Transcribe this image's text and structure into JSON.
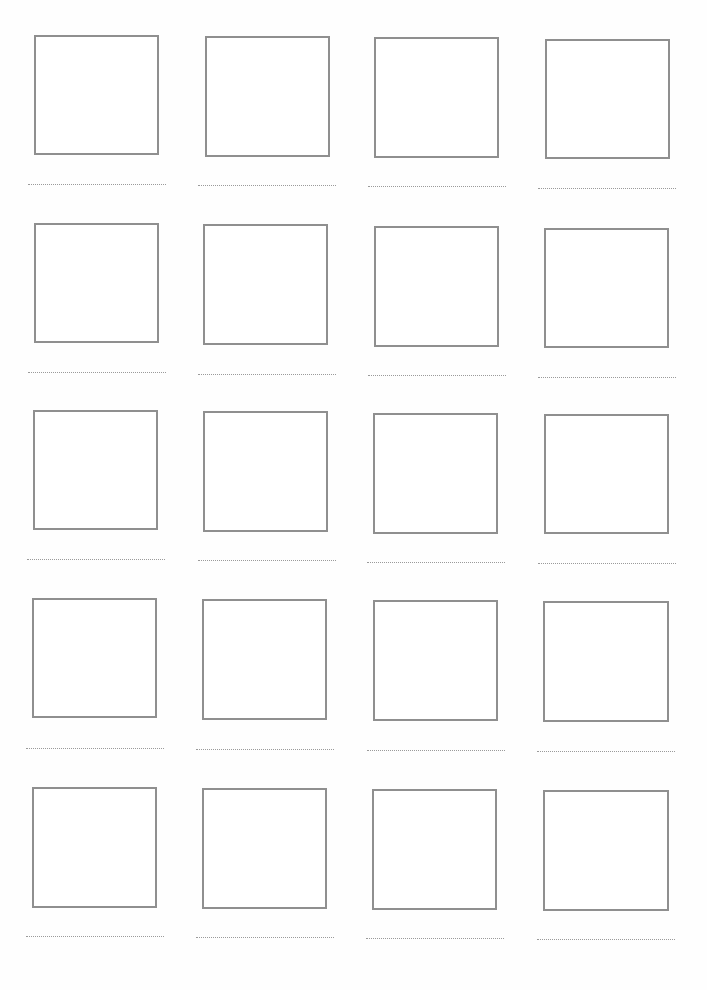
{
  "worksheet": {
    "rows": 5,
    "columns": 4,
    "box_border_color": "#8f8f8f",
    "line_color": "#9a9a9a",
    "cells": [
      {
        "row": 1,
        "col": 1,
        "box": [
          34,
          35,
          125,
          120
        ],
        "line": [
          28,
          184,
          138
        ]
      },
      {
        "row": 1,
        "col": 2,
        "box": [
          205,
          36,
          125,
          121
        ],
        "line": [
          198,
          185,
          138
        ]
      },
      {
        "row": 1,
        "col": 3,
        "box": [
          374,
          37,
          125,
          121
        ],
        "line": [
          368,
          186,
          138
        ]
      },
      {
        "row": 1,
        "col": 4,
        "box": [
          545,
          39,
          125,
          120
        ],
        "line": [
          538,
          188,
          138
        ]
      },
      {
        "row": 2,
        "col": 1,
        "box": [
          34,
          223,
          125,
          120
        ],
        "line": [
          28,
          372,
          138
        ]
      },
      {
        "row": 2,
        "col": 2,
        "box": [
          203,
          224,
          125,
          121
        ],
        "line": [
          198,
          374,
          138
        ]
      },
      {
        "row": 2,
        "col": 3,
        "box": [
          374,
          226,
          125,
          121
        ],
        "line": [
          368,
          375,
          138
        ]
      },
      {
        "row": 2,
        "col": 4,
        "box": [
          544,
          228,
          125,
          120
        ],
        "line": [
          538,
          377,
          138
        ]
      },
      {
        "row": 3,
        "col": 1,
        "box": [
          33,
          410,
          125,
          120
        ],
        "line": [
          27,
          559,
          138
        ]
      },
      {
        "row": 3,
        "col": 2,
        "box": [
          203,
          411,
          125,
          121
        ],
        "line": [
          198,
          560,
          138
        ]
      },
      {
        "row": 3,
        "col": 3,
        "box": [
          373,
          413,
          125,
          121
        ],
        "line": [
          367,
          562,
          138
        ]
      },
      {
        "row": 3,
        "col": 4,
        "box": [
          544,
          414,
          125,
          120
        ],
        "line": [
          538,
          563,
          138
        ]
      },
      {
        "row": 4,
        "col": 1,
        "box": [
          32,
          598,
          125,
          120
        ],
        "line": [
          26,
          748,
          138
        ]
      },
      {
        "row": 4,
        "col": 2,
        "box": [
          202,
          599,
          125,
          121
        ],
        "line": [
          196,
          749,
          138
        ]
      },
      {
        "row": 4,
        "col": 3,
        "box": [
          373,
          600,
          125,
          121
        ],
        "line": [
          367,
          750,
          138
        ]
      },
      {
        "row": 4,
        "col": 4,
        "box": [
          543,
          601,
          126,
          121
        ],
        "line": [
          537,
          751,
          138
        ]
      },
      {
        "row": 5,
        "col": 1,
        "box": [
          32,
          787,
          125,
          121
        ],
        "line": [
          26,
          936,
          138
        ]
      },
      {
        "row": 5,
        "col": 2,
        "box": [
          202,
          788,
          125,
          121
        ],
        "line": [
          196,
          937,
          138
        ]
      },
      {
        "row": 5,
        "col": 3,
        "box": [
          372,
          789,
          125,
          121
        ],
        "line": [
          366,
          938,
          138
        ]
      },
      {
        "row": 5,
        "col": 4,
        "box": [
          543,
          790,
          126,
          121
        ],
        "line": [
          537,
          939,
          138
        ]
      }
    ]
  }
}
